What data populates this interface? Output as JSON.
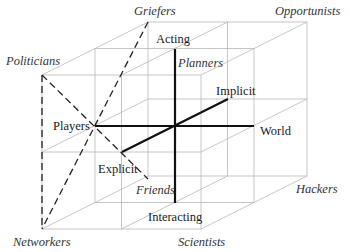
{
  "diagram": {
    "colors": {
      "grid": "#b8b8b8",
      "axis": "#111111",
      "dashed": "#222222",
      "text": "#1a1a1a"
    },
    "geometry": {
      "front_face": {
        "left": 42,
        "right": 201,
        "top": 75,
        "bottom": 229
      },
      "depth_offset": {
        "dx": 106,
        "dy": -53
      }
    },
    "axes": [
      {
        "id": "acting-interacting",
        "from": [
          175,
          49
        ],
        "to": [
          175,
          203
        ],
        "labels": [
          "Acting",
          "Interacting"
        ]
      },
      {
        "id": "players-world",
        "from": [
          95,
          126
        ],
        "to": [
          254,
          126
        ],
        "labels": [
          "Players",
          "World"
        ]
      },
      {
        "id": "explicit-implicit",
        "from": [
          122,
          152
        ],
        "to": [
          228,
          99
        ],
        "labels": [
          "Explicit",
          "Implicit"
        ]
      }
    ],
    "dashed_lines": [
      {
        "id": "politicians-to-friends-corner",
        "from": [
          42,
          75
        ],
        "to": [
          148,
          179
        ]
      },
      {
        "id": "griefers-to-networkers",
        "from": [
          148,
          22
        ],
        "to": [
          42,
          229
        ]
      },
      {
        "id": "politicians-to-networkers",
        "from": [
          42,
          75
        ],
        "to": [
          42,
          229
        ]
      }
    ],
    "axis_labels": {
      "acting": "Acting",
      "interacting": "Interacting",
      "players": "Players",
      "world": "World",
      "implicit": "Implicit",
      "explicit": "Explicit"
    },
    "role_labels": {
      "griefers": "Griefers",
      "opportunists": "Opportunists",
      "politicians": "Politicians",
      "planners": "Planners",
      "friends": "Friends",
      "networkers": "Networkers",
      "scientists": "Scientists",
      "hackers": "Hackers"
    }
  }
}
